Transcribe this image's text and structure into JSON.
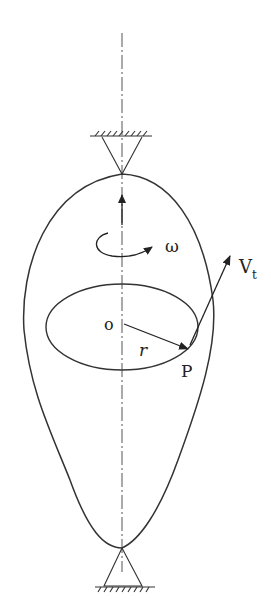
{
  "diagram": {
    "labels": {
      "omega": "ω",
      "velocity": "V",
      "velocity_sub": "t",
      "origin": "o",
      "radius": "r",
      "point": "P"
    },
    "colors": {
      "stroke": "#333333",
      "background": "#ffffff"
    }
  }
}
